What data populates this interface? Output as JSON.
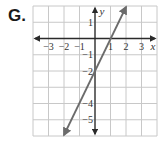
{
  "label": "G.",
  "chart_data": {
    "type": "line",
    "title": "",
    "xlabel": "x",
    "ylabel": "y",
    "xlim": [
      -4,
      4
    ],
    "ylim": [
      -6,
      2
    ],
    "grid": true,
    "x_ticks": [
      "-3",
      "-2",
      "-1",
      "1",
      "2",
      "3"
    ],
    "y_ticks": [
      "1",
      "-1",
      "-2",
      "-4",
      "-5"
    ],
    "series": [
      {
        "name": "line",
        "equation": "y = 2x - 2",
        "x": [
          -2,
          2
        ],
        "y": [
          -6,
          2
        ],
        "arrows": "both"
      }
    ],
    "colors": {
      "line": "#6b6b6b",
      "axis": "#2a2a2a",
      "grid": "#c8c8c8"
    }
  }
}
